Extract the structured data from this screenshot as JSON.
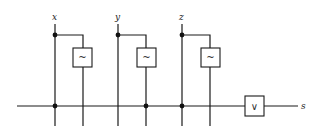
{
  "diagram": {
    "title": "",
    "inputs": [
      {
        "name": "x",
        "label": "x"
      },
      {
        "name": "y",
        "label": "y"
      },
      {
        "name": "z",
        "label": "z"
      }
    ],
    "negation_gates": [
      {
        "input": "x",
        "symbol": "~"
      },
      {
        "input": "y",
        "symbol": "~"
      },
      {
        "input": "z",
        "symbol": "~"
      }
    ],
    "or_gate": {
      "symbol": "∨"
    },
    "output": {
      "name": "s",
      "label": "s"
    },
    "colors": {
      "line": "#1a1a1a",
      "background": "#ffffff"
    }
  }
}
